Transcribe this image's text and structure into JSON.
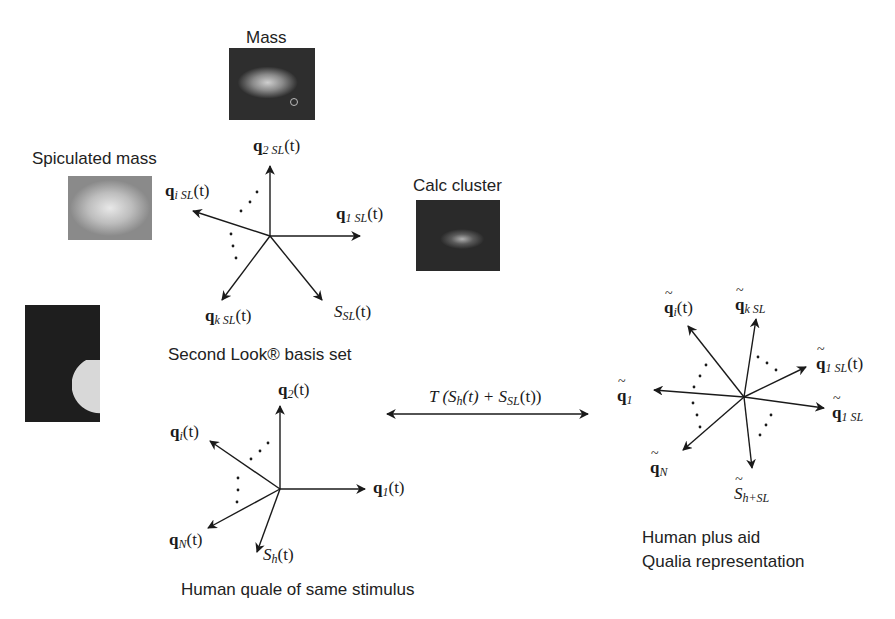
{
  "figure": {
    "thumbnails": {
      "mass": {
        "label": "Mass"
      },
      "spiculated_mass": {
        "label": "Spiculated mass"
      },
      "calc_cluster": {
        "label": "Calc cluster"
      },
      "zoomed_region": {
        "label": ""
      }
    },
    "second_look_basis": {
      "caption": "Second Look® basis set",
      "vectors": {
        "q2": {
          "sym": "q",
          "sub": "2 SL",
          "arg": "(t)"
        },
        "qi": {
          "sym": "q",
          "sub": "i SL",
          "arg": "(t)"
        },
        "q1": {
          "sym": "q",
          "sub": "1 SL",
          "arg": "(t)"
        },
        "qk": {
          "sym": "q",
          "sub": "k SL",
          "arg": "(t)"
        },
        "S": {
          "sym": "S",
          "sub": "SL",
          "arg": "(t)"
        }
      }
    },
    "human_quale": {
      "caption": "Human quale of same stimulus",
      "vectors": {
        "q2": {
          "sym": "q",
          "sub": "2",
          "arg": "(t)"
        },
        "qi": {
          "sym": "q",
          "sub": "i",
          "arg": "(t)"
        },
        "q1": {
          "sym": "q",
          "sub": "1",
          "arg": "(t)"
        },
        "qN": {
          "sym": "q",
          "sub": "N",
          "arg": "(t)"
        },
        "S": {
          "sym": "S",
          "sub": "h",
          "arg": "(t)"
        }
      }
    },
    "transform": {
      "prefix": "T (S",
      "sub1": "h",
      "mid": "(t) + S",
      "sub2": "SL",
      "suffix": "(t))"
    },
    "combined": {
      "caption_line1": "Human plus aid",
      "caption_line2": "Qualia representation",
      "vectors": {
        "qi": {
          "sym": "q",
          "sub": "i",
          "arg": "(t)"
        },
        "qk": {
          "sym": "q",
          "sub": "k SL",
          "arg": ""
        },
        "q1SLt": {
          "sym": "q",
          "sub": "1 SL",
          "arg": "(t)"
        },
        "q1": {
          "sym": "q",
          "sub": "1",
          "arg": ""
        },
        "q1SL": {
          "sym": "q",
          "sub": "1 SL",
          "arg": ""
        },
        "qN": {
          "sym": "q",
          "sub": "N",
          "arg": ""
        },
        "S": {
          "sym": "S",
          "sub": "h+SL",
          "arg": ""
        }
      }
    }
  }
}
